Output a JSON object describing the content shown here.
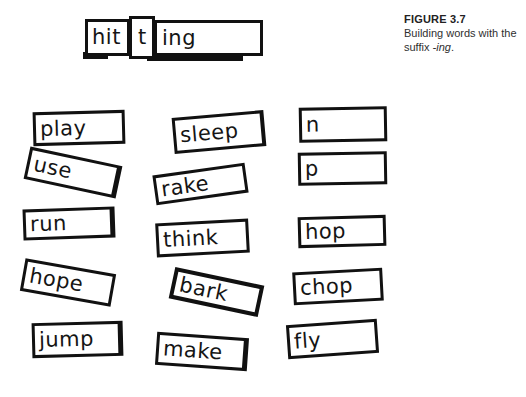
{
  "figure": {
    "caption_title": "FIGURE 3.7",
    "caption_line1": "Building words with the",
    "caption_line2_prefix": "suffix ",
    "caption_line2_italic": "-ing",
    "caption_line2_suffix": "."
  },
  "builder": {
    "segments": [
      {
        "text": "hit"
      },
      {
        "text": "t"
      },
      {
        "text": "ing"
      }
    ]
  },
  "cards": [
    {
      "word": "play"
    },
    {
      "word": "use"
    },
    {
      "word": "run"
    },
    {
      "word": "hope"
    },
    {
      "word": "jump"
    },
    {
      "word": "sleep"
    },
    {
      "word": "rake"
    },
    {
      "word": "think"
    },
    {
      "word": "bark"
    },
    {
      "word": "make"
    },
    {
      "word": "n"
    },
    {
      "word": "p"
    },
    {
      "word": "hop"
    },
    {
      "word": "chop"
    },
    {
      "word": "fly"
    }
  ],
  "colors": {
    "background": "#ffffff",
    "card_border": "#111111",
    "card_text": "#151515",
    "caption_text": "#2f2f2f"
  }
}
